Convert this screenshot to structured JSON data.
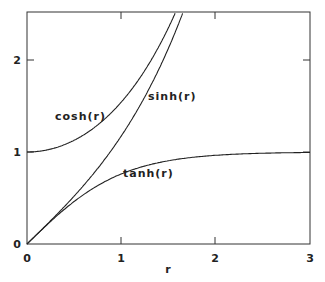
{
  "chart_data": {
    "type": "line",
    "title": "",
    "xlabel": "r",
    "ylabel": "",
    "xlim": [
      0,
      3
    ],
    "ylim": [
      0,
      2.5
    ],
    "grid": false,
    "x_ticks": [
      "0",
      "1",
      "2",
      "3"
    ],
    "y_ticks": [
      "0",
      "1",
      "2"
    ],
    "series": [
      {
        "name": "cosh(r)",
        "x": [
          0,
          0.25,
          0.5,
          0.75,
          1.0,
          1.25,
          1.5,
          1.57
        ],
        "values": [
          1.0,
          1.031,
          1.128,
          1.295,
          1.543,
          1.888,
          2.352,
          2.5
        ]
      },
      {
        "name": "sinh(r)",
        "x": [
          0,
          0.25,
          0.5,
          0.75,
          1.0,
          1.25,
          1.5,
          1.65
        ],
        "values": [
          0,
          0.253,
          0.521,
          0.822,
          1.175,
          1.602,
          2.129,
          2.5
        ]
      },
      {
        "name": "tanh(r)",
        "x": [
          0,
          0.5,
          1.0,
          1.5,
          2.0,
          2.5,
          3.0
        ],
        "values": [
          0,
          0.462,
          0.762,
          0.905,
          0.964,
          0.987,
          0.995
        ]
      }
    ],
    "annotations": [
      {
        "text": "cosh(r)",
        "x": 0.55,
        "y": 1.3
      },
      {
        "text": "sinh(r)",
        "x": 1.4,
        "y": 1.55
      },
      {
        "text": "tanh(r)",
        "x": 1.35,
        "y": 0.62
      }
    ]
  },
  "labels": {
    "xlabel": "r",
    "cosh": "cosh(r)",
    "sinh": "sinh(r)",
    "tanh": "tanh(r)",
    "x0": "0",
    "x1": "1",
    "x2": "2",
    "x3": "3",
    "y0": "0",
    "y1": "1",
    "y2": "2"
  }
}
